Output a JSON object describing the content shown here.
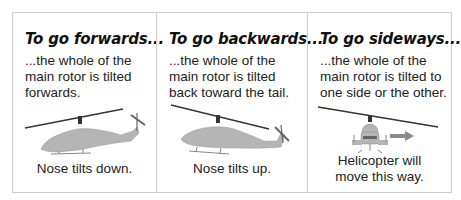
{
  "panels": [
    {
      "title": "To go forwards...",
      "description": "...the whole of the main rotor is tilted forwards.",
      "caption": "Nose tilts down.",
      "illustration": "helicopter-side-view-nose-down-icon"
    },
    {
      "title": "To go backwards...",
      "description": "...the whole of the main rotor is tilted back toward the tail.",
      "caption": "Nose tilts up.",
      "illustration": "helicopter-side-view-nose-up-icon"
    },
    {
      "title": "To go sideways...",
      "description": "...the whole of the main rotor is tilted to one side or the other.",
      "caption_line1": "Helicopter will",
      "caption_line2": "move this way.",
      "illustration": "helicopter-front-view-icon",
      "arrow": "right-arrow-icon"
    }
  ],
  "colors": {
    "border": "#cfcfcf",
    "helicopter_fill": "#b5b5b5",
    "rotor": "#333333",
    "arrow": "#8a8a8a"
  }
}
